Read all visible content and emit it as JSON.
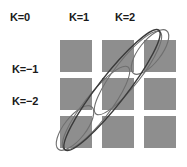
{
  "figure": {
    "title": "",
    "background_color": "#ffffff",
    "cell_color": "#8e8e8e",
    "ellipse_color_light": "#6f6f6f",
    "ellipse_color_dark": "#3a3a3a"
  },
  "column_labels": [
    {
      "text": "K=0",
      "name": "column-label-k0"
    },
    {
      "text": "K=1",
      "name": "column-label-k1"
    },
    {
      "text": "K=2",
      "name": "column-label-k2"
    }
  ],
  "row_labels": [
    {
      "text": "K=−1",
      "name": "row-label-k-minus-1"
    },
    {
      "text": "K=−2",
      "name": "row-label-k-minus-2"
    }
  ],
  "chart_data": {
    "type": "diagram",
    "title": "",
    "xlabel": "",
    "ylabel": "",
    "grid": {
      "rows": 3,
      "cols": 3,
      "cell_width": 32,
      "cell_height": 32,
      "gap_x": 10,
      "gap_y": 6,
      "origin_x": 60,
      "origin_y": 40,
      "fill": "#8e8e8e"
    },
    "cells": [
      {
        "row": 0,
        "col": 0,
        "k_col": "K=0",
        "k_row": "K=0"
      },
      {
        "row": 0,
        "col": 1,
        "k_col": "K=1",
        "k_row": "K=0"
      },
      {
        "row": 0,
        "col": 2,
        "k_col": "K=2",
        "k_row": "K=0"
      },
      {
        "row": 1,
        "col": 0,
        "k_col": "K=0",
        "k_row": "K=−1"
      },
      {
        "row": 1,
        "col": 1,
        "k_col": "K=1",
        "k_row": "K=−1"
      },
      {
        "row": 1,
        "col": 2,
        "k_col": "K=2",
        "k_row": "K=−1"
      },
      {
        "row": 2,
        "col": 0,
        "k_col": "K=0",
        "k_row": "K=−2"
      },
      {
        "row": 2,
        "col": 1,
        "k_col": "K=1",
        "k_row": "K=−2"
      },
      {
        "row": 2,
        "col": 2,
        "k_col": "K=2",
        "k_row": "K=−2"
      }
    ],
    "ellipses": [
      {
        "name": "ellipse-corner-top-right",
        "cx": 150,
        "cy": 52,
        "rx": 27,
        "ry": 11,
        "angle": -52,
        "style": "light"
      },
      {
        "name": "ellipse-corner-bottom-left",
        "cx": 75,
        "cy": 128,
        "rx": 27,
        "ry": 11,
        "angle": -52,
        "style": "light"
      },
      {
        "name": "ellipse-mid-upper",
        "cx": 128,
        "cy": 73,
        "rx": 52,
        "ry": 13,
        "angle": -52,
        "style": "light"
      },
      {
        "name": "ellipse-mid-lower",
        "cx": 96,
        "cy": 108,
        "rx": 52,
        "ry": 13,
        "angle": -52,
        "style": "light"
      },
      {
        "name": "ellipse-main-diagonal",
        "cx": 112,
        "cy": 90,
        "rx": 76,
        "ry": 14,
        "angle": -52,
        "style": "dark"
      }
    ],
    "legend": [],
    "annotations": []
  }
}
